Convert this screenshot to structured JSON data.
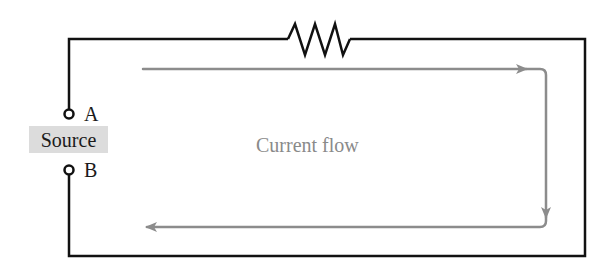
{
  "diagram": {
    "type": "circuit",
    "source": {
      "label": "Source",
      "terminals": [
        {
          "id": "A",
          "label": "A"
        },
        {
          "id": "B",
          "label": "B"
        }
      ]
    },
    "components": [
      {
        "type": "resistor",
        "position": "top-wire"
      }
    ],
    "current": {
      "label": "Current flow",
      "direction": "A → top → right → bottom → B (clockwise)"
    },
    "colors": {
      "wire": "#111111",
      "current_arrow": "#8c8c8c",
      "current_text": "#8a8a8a",
      "source_box": "#dcdcdc",
      "text": "#1a1a1a"
    }
  }
}
